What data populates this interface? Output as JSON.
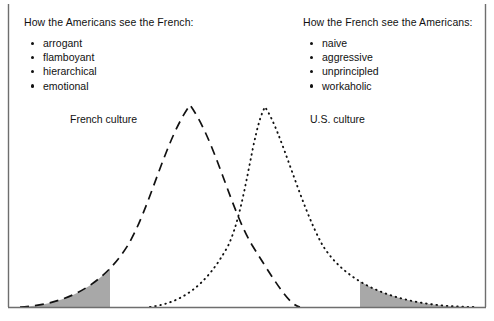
{
  "figure": {
    "type": "diagram",
    "subtype": "overlapping-bell-curves",
    "background_color": "#ffffff",
    "ink_color": "#111111",
    "shade_color": "#a8a8a8",
    "frame": {
      "left_border": true,
      "right_border": true,
      "bottom_border": true,
      "top_border": false
    }
  },
  "left_panel": {
    "heading": "How the Americans see the French:",
    "traits": [
      "arrogant",
      "flamboyant",
      "hierarchical",
      "emotional"
    ]
  },
  "right_panel": {
    "heading": "How the French see the Americans:",
    "traits": [
      "naive",
      "aggressive",
      "unprincipled",
      "workaholic"
    ]
  },
  "curves": {
    "french": {
      "label": "French culture",
      "line_style": "dashed",
      "peak_x": 190,
      "peak_y": 83,
      "baseline_y": 307,
      "start_x": 20,
      "end_x": 300,
      "shaded_tail": "left",
      "shade_from_x": 20,
      "shade_to_x": 110
    },
    "us": {
      "label": "U.S. culture",
      "line_style": "dotted",
      "peak_x": 265,
      "peak_y": 85,
      "baseline_y": 307,
      "start_x": 150,
      "end_x": 477,
      "shaded_tail": "right",
      "shade_from_x": 360,
      "shade_to_x": 477
    }
  }
}
